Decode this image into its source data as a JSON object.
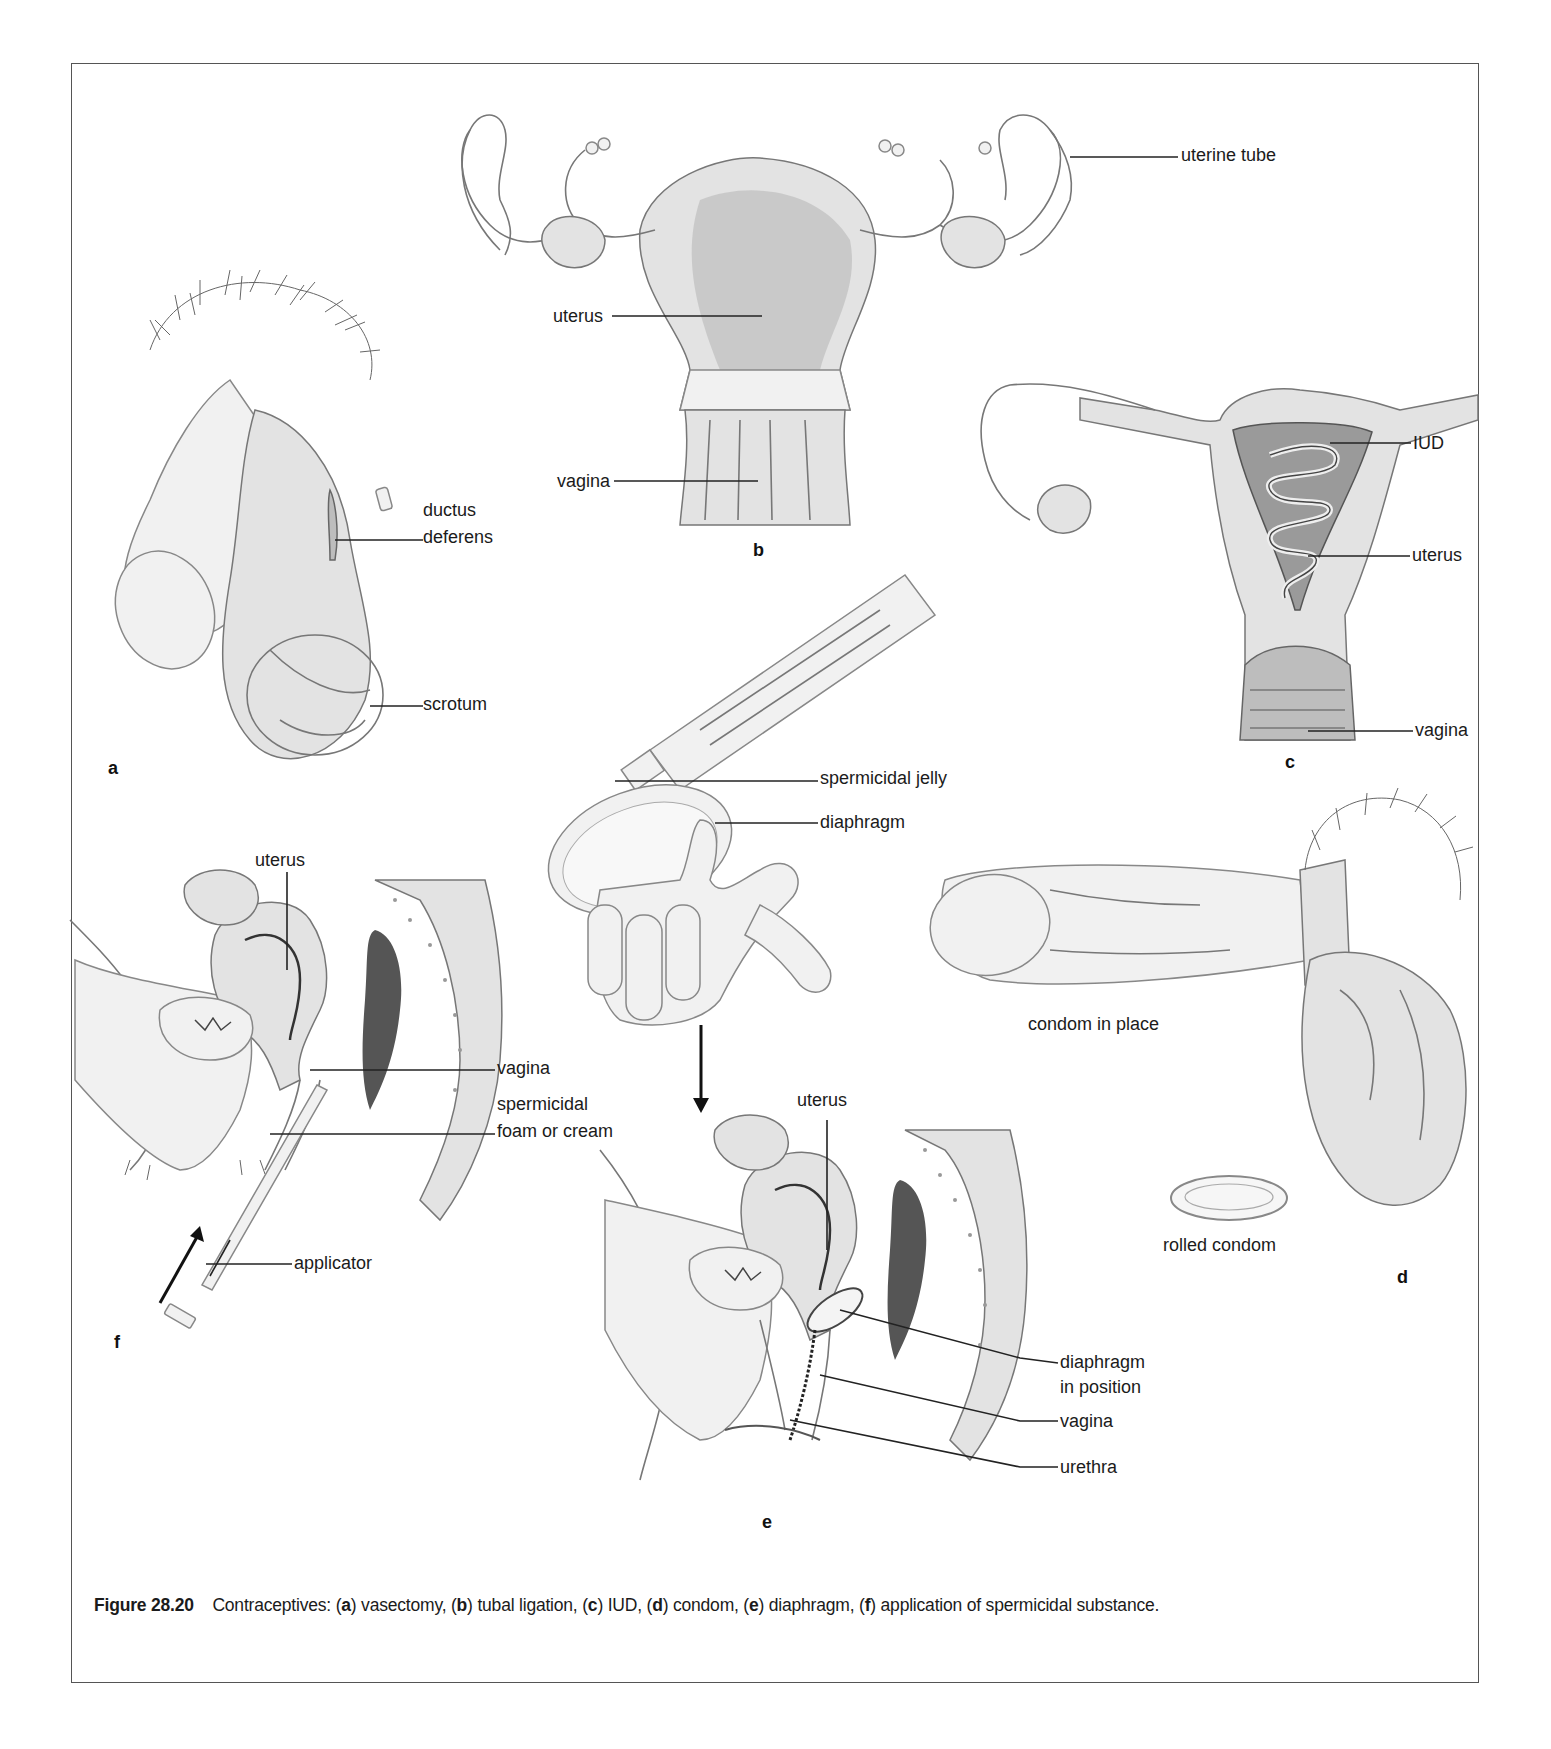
{
  "figure": {
    "number": "Figure 28.20",
    "caption_parts": [
      {
        "text": "Contraceptives: (",
        "bold": false
      },
      {
        "text": "a",
        "bold": true
      },
      {
        "text": ") vasectomy, (",
        "bold": false
      },
      {
        "text": "b",
        "bold": true
      },
      {
        "text": ") tubal ligation, (",
        "bold": false
      },
      {
        "text": "c",
        "bold": true
      },
      {
        "text": ") IUD, (",
        "bold": false
      },
      {
        "text": "d",
        "bold": true
      },
      {
        "text": ") condom, (",
        "bold": false
      },
      {
        "text": "e",
        "bold": true
      },
      {
        "text": ") diaphragm, (",
        "bold": false
      },
      {
        "text": "f",
        "bold": true
      },
      {
        "text": ") application of spermicidal substance.",
        "bold": false
      }
    ]
  },
  "panels": {
    "a": {
      "letter": "a",
      "title": "vasectomy",
      "labels": {
        "ductus": "ductus",
        "deferens": "deferens",
        "scrotum": "scrotum"
      }
    },
    "b": {
      "letter": "b",
      "title": "tubal ligation",
      "labels": {
        "uterine_tube": "uterine tube",
        "uterus": "uterus",
        "vagina": "vagina"
      }
    },
    "c": {
      "letter": "c",
      "title": "IUD",
      "labels": {
        "iud": "IUD",
        "uterus": "uterus",
        "vagina": "vagina"
      }
    },
    "d": {
      "letter": "d",
      "title": "condom",
      "labels": {
        "condom_in_place": "condom in place",
        "rolled_condom": "rolled condom"
      }
    },
    "e": {
      "letter": "e",
      "title": "diaphragm",
      "labels": {
        "spermicidal_jelly": "spermicidal jelly",
        "diaphragm": "diaphragm",
        "uterus": "uterus",
        "diaphragm_in_position_1": "diaphragm",
        "diaphragm_in_position_2": "in position",
        "vagina": "vagina",
        "urethra": "urethra"
      }
    },
    "f": {
      "letter": "f",
      "title": "application of spermicidal substance",
      "labels": {
        "uterus": "uterus",
        "vagina": "vagina",
        "spermicidal_1": "spermicidal",
        "spermicidal_2": "foam or cream",
        "applicator": "applicator"
      }
    }
  }
}
